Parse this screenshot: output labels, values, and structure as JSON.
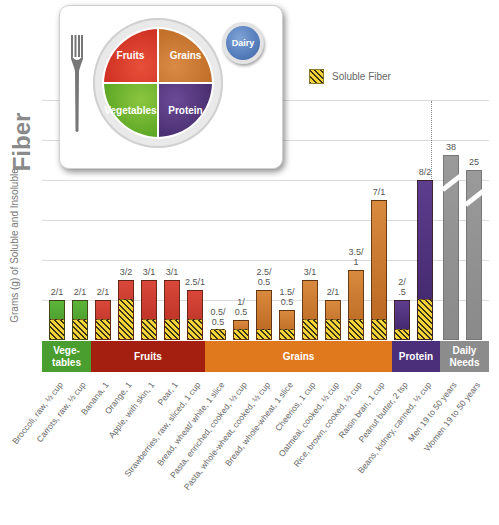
{
  "chart_data": {
    "type": "bar",
    "title": "Fiber",
    "ylabel": "Grams (g) of Soluble and Insoluble",
    "xlabel": "",
    "ylim": [
      0,
      12
    ],
    "grid": true,
    "gridlines_g": [
      2,
      4,
      6,
      8,
      10,
      12
    ],
    "legend": {
      "position": "top-right",
      "entries": [
        "Soluble Fiber"
      ]
    },
    "label_format": "total/soluble",
    "categories": [
      "Broccoli, raw, ½ cup",
      "Carrots, raw, ½ cup",
      "Banana, 1",
      "Orange, 1",
      "Apple, with skin, 1",
      "Pear, 1",
      "Strawberries, raw, sliced, 1 cup",
      "Bread, wheat/ white, 1 slice",
      "Pasta, enriched, cooked, ½ cup",
      "Pasta, whole-wheat, cooked, ½ cup",
      "Bread, whole-wheat, 1 slice",
      "Cheerios, 1 cup",
      "Oatmeal, cooked, ½ cup",
      "Rice, brown, cooked, ½ cup",
      "Raisin bran, 1 cup",
      "Peanut butter, 2 tsp",
      "Beans, kidney, canned, ½ cup",
      "Men 19 to 50 years",
      "Women 19 to 50 years"
    ],
    "groups": [
      {
        "name": "Vege-\ntables",
        "color": "#4a9e2f",
        "members": [
          0,
          1
        ]
      },
      {
        "name": "Fruits",
        "color": "#a8200f",
        "members": [
          2,
          3,
          4,
          5,
          6
        ]
      },
      {
        "name": "Grains",
        "color": "#e0781e",
        "members": [
          7,
          8,
          9,
          10,
          11,
          12,
          13,
          14
        ]
      },
      {
        "name": "Protein",
        "color": "#4b2f7a",
        "members": [
          15,
          16
        ]
      },
      {
        "name": "Daily\nNeeds",
        "color": "#8c8c8c",
        "members": [
          17,
          18
        ]
      }
    ],
    "series": [
      {
        "name": "Total Fiber",
        "values": [
          2,
          2,
          2,
          3,
          3,
          3,
          2.5,
          0.5,
          1,
          2.5,
          1.5,
          3,
          2,
          3.5,
          7,
          2,
          8,
          38,
          25
        ]
      },
      {
        "name": "Soluble Fiber",
        "values": [
          1,
          1,
          1,
          2,
          1,
          1,
          1,
          0.5,
          0.5,
          0.5,
          0.5,
          1,
          1,
          1,
          1,
          0.5,
          2,
          null,
          null
        ]
      }
    ],
    "value_labels": [
      "2/1",
      "2/1",
      "2/1",
      "3/2",
      "3/1",
      "3/1",
      "2.5/1",
      "0.5/\n0.5",
      "1/\n0.5",
      "2.5/\n0.5",
      "1.5/\n0.5",
      "3/1",
      "2/1",
      "3.5/\n1",
      "7/1",
      "2/\n.5",
      "8/2",
      "38",
      "25"
    ],
    "axis_break": {
      "bars": [
        17,
        18
      ],
      "note": "Daily Needs bars truncated with break marks"
    }
  },
  "figure": {
    "title": "Fiber",
    "ylabel": "Grams (g) of Soluble and Insoluble",
    "legend_label": "Soluble Fiber",
    "plate": {
      "fruits": "Fruits",
      "grains": "Grains",
      "vegetables": "Vegetables",
      "protein": "Protein",
      "dairy": "Dairy"
    }
  }
}
